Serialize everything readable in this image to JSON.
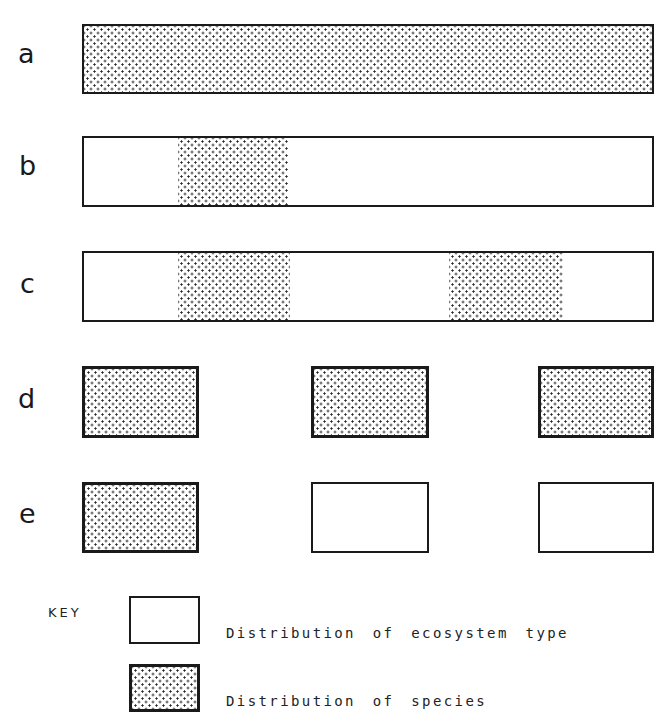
{
  "diagram": {
    "title": "",
    "rows": [
      {
        "label": "a",
        "description": "Continuous ecosystem type; species distributed throughout"
      },
      {
        "label": "b",
        "description": "Continuous ecosystem type; species in one patch"
      },
      {
        "label": "c",
        "description": "Continuous ecosystem type; species in two patches"
      },
      {
        "label": "d",
        "description": "Three fragmented ecosystem patches; species in all three"
      },
      {
        "label": "e",
        "description": "Three fragmented ecosystem patches; species in one only"
      }
    ],
    "key": {
      "title": "KEY",
      "ecosystem_label": "Distribution of ecosystem type",
      "species_label": "Distribution of species"
    },
    "colors": {
      "outline": "#1a1a1a",
      "stipple_dot": "#2a2a2a",
      "background": "#ffffff"
    }
  }
}
